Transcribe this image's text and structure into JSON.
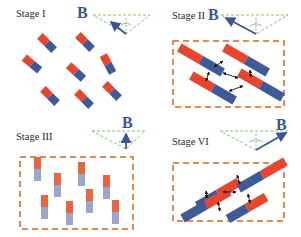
{
  "colors": {
    "red": "#e8452c",
    "blue": "#3f5a99",
    "pale_red": "#e9653f",
    "pale_blue": "#9aa6cc",
    "frame": "#e8894a",
    "triangle": "#8cc06c",
    "field": "#3a5596",
    "text": "#2b2b2b"
  },
  "panels": [
    {
      "id": "stage1",
      "title": "Stage I",
      "field_label": "B",
      "field_direction": "upper-left"
    },
    {
      "id": "stage2",
      "title": "Stage II",
      "field_label": "B",
      "field_direction": "upper-left"
    },
    {
      "id": "stage3",
      "title": "Stage III",
      "field_label": "B",
      "field_direction": "up"
    },
    {
      "id": "stage4",
      "title": "Stage VI",
      "field_label": "B",
      "field_direction": "upper-right"
    }
  ]
}
